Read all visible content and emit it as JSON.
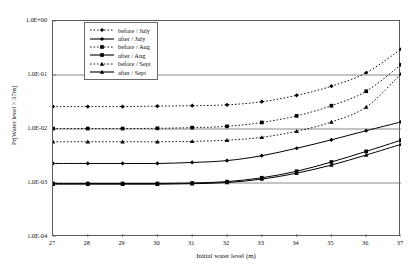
{
  "chart_data": {
    "type": "line",
    "title": "",
    "xlabel": "Initial water level (m)",
    "ylabel": "Pr[Water level > 37m]",
    "x": [
      27,
      28,
      29,
      30,
      31,
      32,
      33,
      34,
      35,
      36,
      37
    ],
    "xlim": [
      27,
      37
    ],
    "ylim": [
      0.0001,
      1
    ],
    "yscale": "log",
    "ytick_labels": [
      "1.0E+00",
      "1.0E-01",
      "1.0E-02",
      "1.0E-03",
      "1.0E-04"
    ],
    "ytick_values": [
      1,
      0.1,
      0.01,
      0.001,
      0.0001
    ],
    "xtick_labels": [
      "27",
      "28",
      "29",
      "30",
      "31",
      "32",
      "33",
      "34",
      "35",
      "36",
      "37"
    ],
    "grid": "horizontal",
    "legend_position": "top-center-inside",
    "series": [
      {
        "name": "before / July",
        "style": "dotted",
        "marker": "diamond",
        "values": [
          0.026,
          0.026,
          0.026,
          0.0265,
          0.027,
          0.028,
          0.032,
          0.042,
          0.062,
          0.11,
          0.3
        ]
      },
      {
        "name": "after / July",
        "style": "solid",
        "marker": "diamond",
        "values": [
          0.0023,
          0.0023,
          0.0023,
          0.0023,
          0.0024,
          0.0026,
          0.0032,
          0.0044,
          0.0063,
          0.0093,
          0.0135
        ]
      },
      {
        "name": "before / Aug",
        "style": "dotted",
        "marker": "square",
        "values": [
          0.0102,
          0.0102,
          0.0102,
          0.0103,
          0.0106,
          0.0112,
          0.0132,
          0.0175,
          0.027,
          0.05,
          0.155
        ]
      },
      {
        "name": "after / Aug",
        "style": "solid",
        "marker": "square",
        "values": [
          0.00098,
          0.00098,
          0.00098,
          0.00098,
          0.001,
          0.00106,
          0.00125,
          0.00165,
          0.00245,
          0.00385,
          0.0062
        ]
      },
      {
        "name": "before / Sept",
        "style": "dotted",
        "marker": "triangle",
        "values": [
          0.0058,
          0.0058,
          0.0058,
          0.0058,
          0.0059,
          0.0062,
          0.007,
          0.0091,
          0.0135,
          0.0255,
          0.105
        ]
      },
      {
        "name": "after / Sept",
        "style": "solid",
        "marker": "triangle",
        "values": [
          0.00095,
          0.00095,
          0.00095,
          0.00095,
          0.00097,
          0.00102,
          0.00118,
          0.00152,
          0.00215,
          0.0033,
          0.0052
        ]
      }
    ]
  }
}
